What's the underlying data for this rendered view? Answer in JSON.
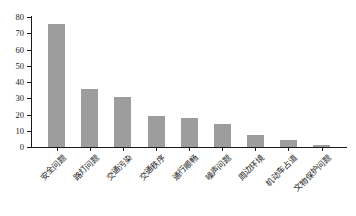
{
  "chart_data": {
    "type": "bar",
    "title": "",
    "subtitle": "",
    "xlabel": "",
    "ylabel": "",
    "categories": [
      "安全问题",
      "路灯问题",
      "交通污染",
      "交通秩序",
      "通行顺畅",
      "噪声问题",
      "周边环境",
      "机动车占道",
      "文物保护问题"
    ],
    "values": [
      76,
      36,
      31,
      19,
      18,
      14,
      7.5,
      4.5,
      1.5
    ],
    "ylim": [
      0,
      80
    ],
    "ytick_labels": [
      "0",
      "10",
      "20",
      "30",
      "40",
      "50",
      "60",
      "70",
      "80"
    ],
    "ytick_values": [
      0,
      10,
      20,
      30,
      40,
      50,
      60,
      70,
      80
    ],
    "grid": false,
    "legend": null,
    "bar_color": "#9d9d9d",
    "axis_color": "#1a1a1a",
    "background": "#ffffff",
    "label_rotation_deg": -45
  }
}
